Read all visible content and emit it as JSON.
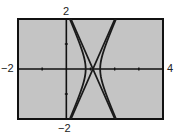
{
  "chart_data": {
    "type": "line",
    "title": "",
    "xlabel": "",
    "ylabel": "",
    "xlim": [
      -2,
      4
    ],
    "ylim": [
      -2,
      2
    ],
    "xscale_ticks": 1,
    "yscale_ticks": 1,
    "grid": false,
    "window_labels": {
      "xmin": "−2",
      "xmax": "4",
      "ymin": "−2",
      "ymax": "2"
    },
    "background": "#c4c4c4",
    "curve_color": "#1a1a1a",
    "series": [
      {
        "name": "asymptote-lines",
        "kind": "lines",
        "center_x": 1.1,
        "slope": 2.2,
        "equation": "y = ±2.2(x − 1.1)"
      },
      {
        "name": "hyperbola",
        "kind": "hyperbola",
        "center_x": 1.1,
        "a": 0.3,
        "b": 0.66,
        "equation": "(x − 1.1)²/0.09 − y²/0.4356 = 1"
      }
    ]
  }
}
